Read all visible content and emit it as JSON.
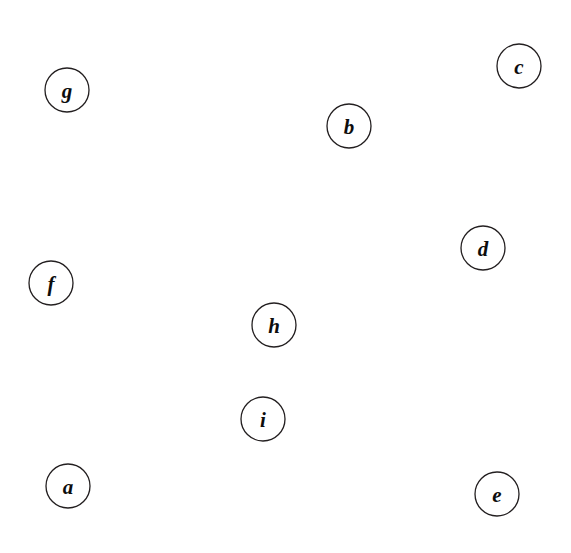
{
  "figure": {
    "name": "undirected-graph-drawing",
    "style": "hand-drawn ribbon edges, white filled circular vertices, italic serif letter labels",
    "background_color": "#ffffff",
    "line_color": "#231f20",
    "width": 571,
    "height": 553
  },
  "chart_data": {
    "type": "diagram",
    "subtype": "node-link-graph",
    "directed": false,
    "node_count": 9,
    "edge_count": 16,
    "nodes": [
      {
        "id": "a",
        "label": "a",
        "x": 68,
        "y": 486,
        "r": 22,
        "degree": 2
      },
      {
        "id": "b",
        "label": "b",
        "x": 349,
        "y": 126,
        "r": 22,
        "degree": 4
      },
      {
        "id": "c",
        "label": "c",
        "x": 519,
        "y": 66,
        "r": 22,
        "degree": 3
      },
      {
        "id": "d",
        "label": "d",
        "x": 483,
        "y": 248,
        "r": 22,
        "degree": 4
      },
      {
        "id": "e",
        "label": "e",
        "x": 497,
        "y": 494,
        "r": 22,
        "degree": 7
      },
      {
        "id": "f",
        "label": "f",
        "x": 51,
        "y": 283,
        "r": 22,
        "degree": 4
      },
      {
        "id": "g",
        "label": "g",
        "x": 67,
        "y": 90,
        "r": 22,
        "degree": 3
      },
      {
        "id": "h",
        "label": "h",
        "x": 274,
        "y": 325,
        "r": 22,
        "degree": 4
      },
      {
        "id": "i",
        "label": "i",
        "x": 263,
        "y": 419,
        "r": 22,
        "degree": 2
      }
    ],
    "edges": [
      {
        "source": "g",
        "target": "c",
        "name": "edge-g-c"
      },
      {
        "source": "g",
        "target": "f",
        "name": "edge-g-f"
      },
      {
        "source": "g",
        "target": "e",
        "name": "edge-g-e"
      },
      {
        "source": "b",
        "target": "c",
        "name": "edge-b-c"
      },
      {
        "source": "b",
        "target": "d",
        "name": "edge-b-d"
      },
      {
        "source": "b",
        "target": "e",
        "name": "edge-b-e"
      },
      {
        "source": "b",
        "target": "f",
        "name": "edge-b-f"
      },
      {
        "source": "c",
        "target": "e",
        "name": "edge-c-e"
      },
      {
        "source": "d",
        "target": "e",
        "name": "edge-d-e"
      },
      {
        "source": "d",
        "target": "a",
        "name": "edge-d-a"
      },
      {
        "source": "d",
        "target": "h",
        "name": "edge-d-h"
      },
      {
        "source": "f",
        "target": "h",
        "name": "edge-f-h"
      },
      {
        "source": "f",
        "target": "e",
        "name": "edge-f-e"
      },
      {
        "source": "h",
        "target": "i",
        "name": "edge-h-i"
      },
      {
        "source": "h",
        "target": "e",
        "name": "edge-h-e"
      },
      {
        "source": "a",
        "target": "e",
        "name": "edge-a-e"
      },
      {
        "source": "i",
        "target": "e",
        "name": "edge-i-e"
      }
    ],
    "edge_paths": {
      "edge-g-c": "M 84,78 C 170,18 380,8 505,50",
      "edge-g-f": "M 62,112 C 50,160 44,220 48,261",
      "edge-g-e": "M 86,100 C 200,190 370,360 480,478",
      "edge-b-c": "M 370,118 C 420,92 470,72 498,66",
      "edge-b-d": "M 362,146 C 400,190 450,226 468,236",
      "edge-b-e": "M 352,148 C 362,250 400,400 482,476",
      "edge-b-f": "M 327,130 C 240,158 110,240 70,272",
      "edge-c-e": "M 528,86 C 552,200 545,400 512,478",
      "edge-d-e": "M 486,270 C 492,330 496,420 496,472",
      "edge-d-a": "M 462,252 C 330,330 140,430 88,478",
      "edge-d-h": "M 464,240 C 420,150 330,140 290,200 C 266,238 270,280 272,303",
      "edge-f-h": "M 72,276 C 150,250 240,268 270,303",
      "edge-f-e": "M 64,302 C 150,380 360,470 475,490",
      "edge-h-i": "M 272,347 C 270,368 266,392 265,397",
      "edge-h-e": "M 296,330 C 360,360 440,430 482,480",
      "edge-a-e": "M 90,490 C 200,560 400,540 478,502",
      "edge-i-e": "M 284,414 C 350,420 440,460 477,484"
    },
    "vertex_labels": [
      "a",
      "b",
      "c",
      "d",
      "e",
      "f",
      "g",
      "h",
      "i"
    ]
  }
}
